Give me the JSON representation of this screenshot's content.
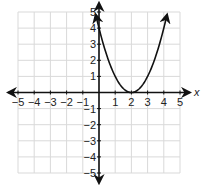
{
  "chart_data": {
    "type": "line",
    "title": "",
    "xlabel": "x",
    "ylabel": "",
    "xlim": [
      -5,
      5
    ],
    "ylim": [
      -5,
      5
    ],
    "grid": true,
    "x_ticks": [
      "-5",
      "-4",
      "-3",
      "-2",
      "-1",
      "1",
      "2",
      "3",
      "4",
      "5"
    ],
    "y_ticks": [
      "5",
      "4",
      "3",
      "2",
      "1",
      "-1",
      "-2",
      "-3",
      "-4",
      "-5"
    ],
    "series": [
      {
        "name": "parabola",
        "equation": "y = (x - 2)^2",
        "x": [
          -0.2,
          0,
          0.5,
          1,
          1.5,
          2,
          2.5,
          3,
          3.5,
          4,
          4.2
        ],
        "values": [
          4.84,
          4,
          2.25,
          1,
          0.25,
          0,
          0.25,
          1,
          2.25,
          4,
          4.84
        ],
        "vertex": [
          2,
          0
        ],
        "arrows_at_ends": true
      }
    ],
    "colors": {
      "grid": "#d9d9d9",
      "axis": "#111111",
      "curve": "#111111"
    }
  }
}
